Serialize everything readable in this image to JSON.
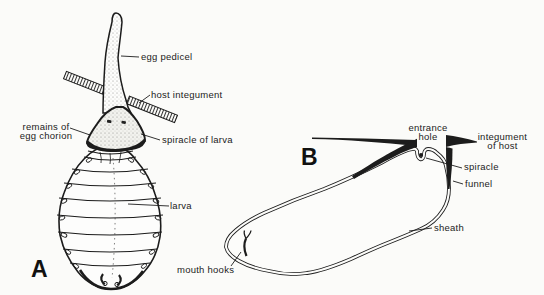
{
  "figure": {
    "ink_color": "#1c1c1c",
    "paper_color": "#fbfbf9",
    "description_panels": 2
  },
  "panel_a": {
    "letter": "A",
    "labels": {
      "egg_pedicel": "egg pedicel",
      "host_integument": "host integument",
      "remains_line1": "remains of",
      "remains_line2": "egg chorion",
      "spiracle_of_larva": "spiracle of larva",
      "larva": "larva"
    }
  },
  "panel_b": {
    "letter": "B",
    "labels": {
      "entrance_hole_line1": "entrance",
      "entrance_hole_line2": "hole",
      "integument_of_host_line1": "integument",
      "integument_of_host_line2": "of host",
      "spiracle": "spiracle",
      "funnel": "funnel",
      "sheath": "sheath",
      "mouth_hooks": "mouth hooks"
    }
  }
}
